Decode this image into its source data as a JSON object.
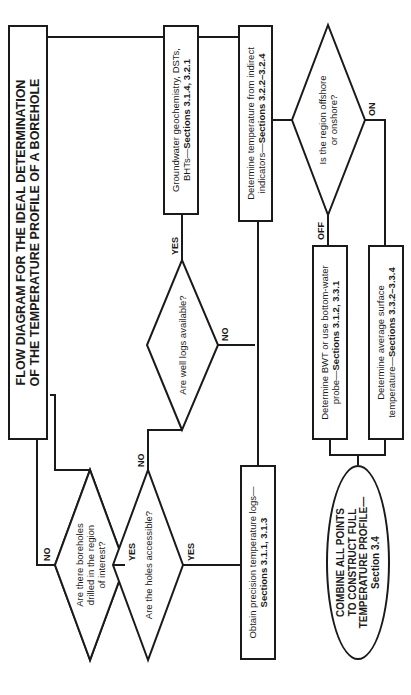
{
  "title": {
    "line1": "FLOW DIAGRAM FOR THE IDEAL DETERMINATION",
    "line2": "OF THE TEMPERATURE PROFILE OF A BOREHOLE"
  },
  "decisions": {
    "boreholes": {
      "line1": "Are there boreholes",
      "line2": "drilled in the region",
      "line3": "of interest?"
    },
    "accessible": {
      "text": "Are the holes accessible?"
    },
    "well_logs": {
      "text": "Are well logs available?"
    },
    "offshore": {
      "line1": "Is the region offshore",
      "line2": "or onshore?"
    }
  },
  "processes": {
    "precision_logs": {
      "text": "Obtain precision temperature logs—",
      "sections": "Sections 3.1.1, 3.1.3"
    },
    "groundwater": {
      "text1": "Groundwater geochemistry, DSTs,",
      "text2": "BHTs—",
      "sections": "Sections 3.1.4, 3.2.1"
    },
    "indirect": {
      "text1": "Determine temperature from indirect",
      "text2": "indicators—",
      "sections": "Sections 3.2.2–3.2.4"
    },
    "bwt": {
      "text1": "Determine BWT or use bottom-water",
      "text2": "probe—",
      "sections": "Sections 3.1.2, 3.3.1"
    },
    "surface": {
      "text1": "Determine average surface",
      "text2": "temperature—",
      "sections": "Sections 3.3.2–3.3.4"
    }
  },
  "terminal": {
    "line1": "COMBINE ALL POINTS",
    "line2": "TO CONSTRUCT FULL",
    "line3": "TEMPERATURE PROFILE—",
    "line4": "Section 3.4"
  },
  "edge_labels": {
    "boreholes_no": "NO",
    "boreholes_yes": "YES",
    "accessible_no": "NO",
    "accessible_yes": "YES",
    "well_logs_yes": "YES",
    "well_logs_no": "NO",
    "offshore_off": "OFF",
    "offshore_on": "ON"
  }
}
